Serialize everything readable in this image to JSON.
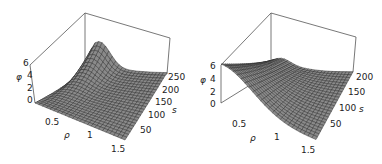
{
  "chart_data": [
    {
      "type": "surface3d",
      "panel": "left",
      "xlabel": "ρ",
      "ylabel": "s",
      "zlabel": "φ",
      "x_ticks": [
        "0.5",
        "1",
        "1.5"
      ],
      "y_ticks": [
        "50",
        "100",
        "150",
        "200",
        "250"
      ],
      "z_ticks": [
        "0",
        "2",
        "4",
        "6"
      ],
      "xlim": [
        0,
        1.6
      ],
      "ylim": [
        0,
        260
      ],
      "zlim": [
        0,
        6
      ],
      "description": "Ridge peaking near rho≈0.3 at s≈250 (phi≈6), decaying with rho; near-zero for small s",
      "sample_points": [
        {
          "rho": 0.0,
          "s": 250,
          "phi": 0.5
        },
        {
          "rho": 0.3,
          "s": 250,
          "phi": 6.0
        },
        {
          "rho": 0.6,
          "s": 250,
          "phi": 3.5
        },
        {
          "rho": 1.0,
          "s": 250,
          "phi": 1.2
        },
        {
          "rho": 1.5,
          "s": 250,
          "phi": 0.3
        },
        {
          "rho": 0.3,
          "s": 150,
          "phi": 2.0
        },
        {
          "rho": 0.3,
          "s": 50,
          "phi": 0.1
        },
        {
          "rho": 1.5,
          "s": 50,
          "phi": 0.0
        }
      ]
    },
    {
      "type": "surface3d",
      "panel": "right",
      "xlabel": "ρ",
      "ylabel": "s",
      "zlabel": "φ",
      "x_ticks": [
        "0.5",
        "1",
        "1.5"
      ],
      "y_ticks": [
        "50",
        "100",
        "150",
        "200"
      ],
      "z_ticks": [
        "0",
        "2",
        "4",
        "6"
      ],
      "xlim": [
        0,
        1.6
      ],
      "ylim": [
        0,
        210
      ],
      "zlim": [
        0,
        6
      ],
      "description": "Maximum phi≈6 at rho=0 for small s, decaying with rho; small bump near rho≈0.2 at large s",
      "sample_points": [
        {
          "rho": 0.0,
          "s": 0,
          "phi": 6.0
        },
        {
          "rho": 0.5,
          "s": 0,
          "phi": 3.0
        },
        {
          "rho": 1.0,
          "s": 0,
          "phi": 0.8
        },
        {
          "rho": 1.5,
          "s": 0,
          "phi": 0.1
        },
        {
          "rho": 0.0,
          "s": 200,
          "phi": 1.2
        },
        {
          "rho": 0.2,
          "s": 200,
          "phi": 1.8
        },
        {
          "rho": 1.5,
          "s": 200,
          "phi": 0.0
        }
      ]
    }
  ],
  "panels": {
    "left": {
      "z_ticks": [
        "6",
        "4",
        "2",
        "0"
      ],
      "z_label": "φ",
      "x_ticks": [
        "0.5",
        "1",
        "1.5"
      ],
      "x_label": "ρ",
      "y_ticks": [
        "250",
        "200",
        "150",
        "100",
        "50"
      ],
      "y_label": "s"
    },
    "right": {
      "z_ticks": [
        "6",
        "4",
        "2",
        "0"
      ],
      "z_label": "φ",
      "x_ticks": [
        "0.5",
        "1",
        "1.5"
      ],
      "x_label": "ρ",
      "y_ticks": [
        "200",
        "150",
        "100",
        "50"
      ],
      "y_label": "s"
    }
  },
  "colors": {
    "surface": "#8a8a8a",
    "mesh": "#2a2a2a",
    "box": "#555555"
  }
}
